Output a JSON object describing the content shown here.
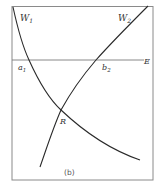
{
  "figure": {
    "caption": "(b)",
    "labels": {
      "w1": "W",
      "w1_sub": "1",
      "w2": "W",
      "w2_sub": "2",
      "a1": "a",
      "a1_sub": "1",
      "b2": "b",
      "b2_sub": "2",
      "e": "E",
      "r": "R"
    },
    "colors": {
      "frame": "#8a8a8a",
      "curve": "#2a2a2a",
      "line": "#7a7a7a",
      "background": "#ffffff"
    }
  }
}
